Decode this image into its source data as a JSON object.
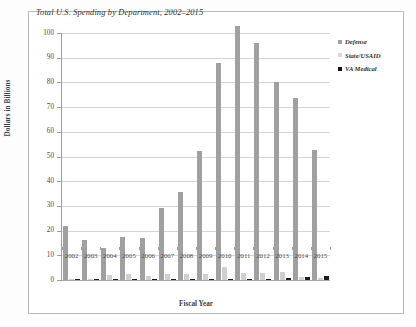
{
  "chart_data": {
    "type": "bar",
    "title": "Total U.S. Spending by Department, 2002–2015",
    "xlabel": "Fiscal Year",
    "ylabel": "Dollars in Billions",
    "ylim": [
      0,
      100
    ],
    "ytick_labels": [
      "100",
      "90",
      "80",
      "70",
      "60",
      "50",
      "40",
      "30",
      "20",
      "10",
      "0"
    ],
    "ytick_values": [
      100,
      90,
      80,
      70,
      60,
      50,
      40,
      30,
      20,
      10,
      0
    ],
    "grid": true,
    "legend_position": "right",
    "categories": [
      "2002",
      "2003",
      "2004",
      "2005",
      "2006",
      "2007",
      "2008",
      "2009",
      "2010",
      "2011",
      "2012",
      "2013",
      "2014",
      "2015"
    ],
    "series": [
      {
        "name": "Defense",
        "color": "#a0a0a0",
        "values": [
          22.0,
          16.3,
          12.8,
          17.5,
          17.1,
          29.0,
          35.8,
          52.1,
          87.7,
          102.8,
          95.9,
          80.1,
          73.5,
          52.8
        ]
      },
      {
        "name": "State/USAID",
        "color": "#cfcfcf",
        "values": [
          0.6,
          0.5,
          1.9,
          2.6,
          1.8,
          2.5,
          2.5,
          2.6,
          5.2,
          2.7,
          3.0,
          3.4,
          1.4,
          1.0
        ]
      },
      {
        "name": "VA Medical",
        "color": "#1d1d1d",
        "values": [
          0.05,
          0.05,
          0.05,
          0.05,
          0.1,
          0.15,
          0.2,
          0.25,
          0.35,
          0.45,
          0.6,
          0.8,
          1.1,
          1.5
        ]
      }
    ]
  }
}
